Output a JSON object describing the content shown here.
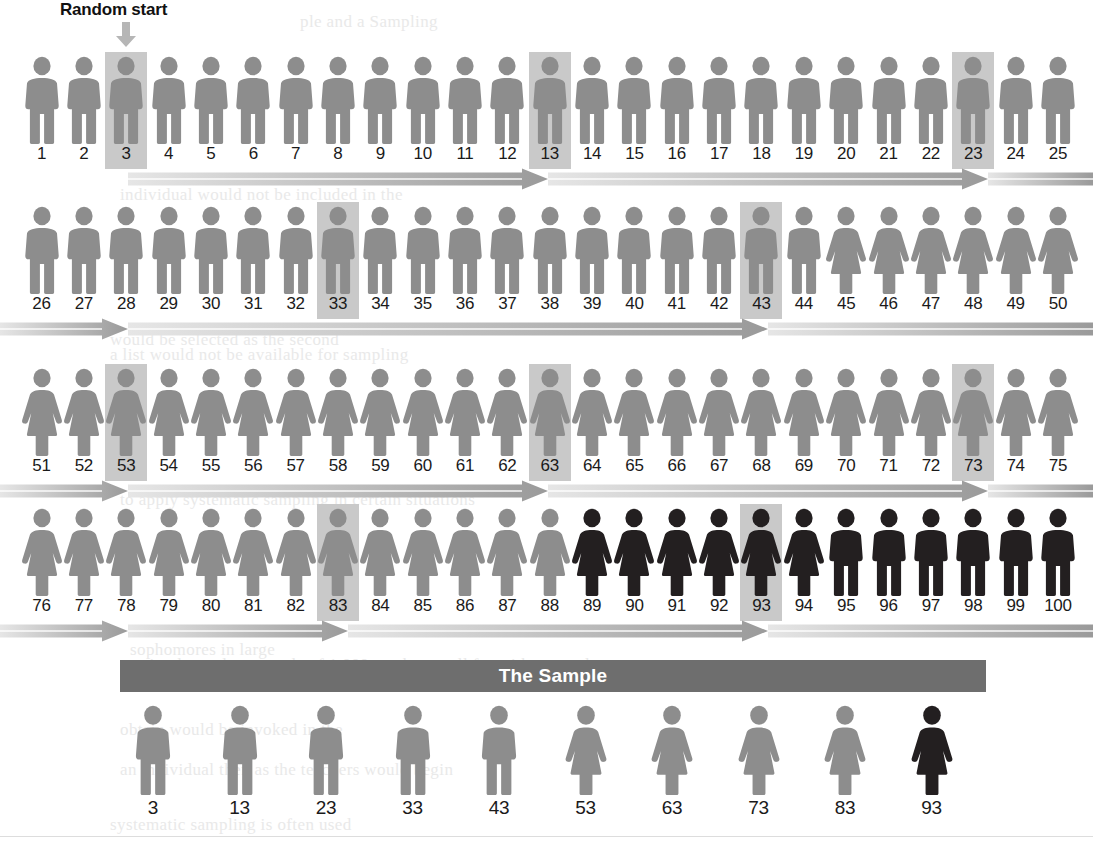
{
  "figure": {
    "title_annotation": "Random start",
    "sample_bar_label": "The Sample",
    "colors": {
      "figure_light_gray": "#8d8d8d",
      "figure_dark": "#231f20",
      "highlight_box": "#c9c9c9",
      "sample_bar": "#6e6e6e",
      "arrow_dark": "#9a9a9a",
      "arrow_light": "#e6e6e6",
      "number_text": "#1a1a1a",
      "background": "#ffffff"
    },
    "icons": {
      "random_start_arrow": "arrow-down-icon",
      "male_figure": "male-person-icon",
      "female_figure": "female-person-icon"
    }
  },
  "chart_data": {
    "type": "diagram",
    "population_size": 100,
    "sample_size": 10,
    "sampling_interval": 10,
    "random_start": 3,
    "selected_units": [
      3,
      13,
      23,
      33,
      43,
      53,
      63,
      73,
      83,
      93
    ],
    "per_row": 25,
    "rows": [
      {
        "start": 1,
        "end": 25,
        "highlighted": [
          3,
          13,
          23
        ]
      },
      {
        "start": 26,
        "end": 50,
        "highlighted": [
          33,
          43
        ]
      },
      {
        "start": 51,
        "end": 75,
        "highlighted": [
          53,
          63,
          73
        ]
      },
      {
        "start": 76,
        "end": 100,
        "highlighted": [
          83,
          93
        ]
      }
    ],
    "unit_styles": {
      "1-44": {
        "sex": "male",
        "shade": "light"
      },
      "45-88": {
        "sex": "female",
        "shade": "light"
      },
      "89-94": {
        "sex": "female",
        "shade": "dark"
      },
      "95-100": {
        "sex": "male",
        "shade": "dark"
      }
    },
    "labels": [
      "1",
      "2",
      "3",
      "4",
      "5",
      "6",
      "7",
      "8",
      "9",
      "10",
      "11",
      "12",
      "13",
      "14",
      "15",
      "16",
      "17",
      "18",
      "19",
      "20",
      "21",
      "22",
      "23",
      "24",
      "25",
      "26",
      "27",
      "28",
      "29",
      "30",
      "31",
      "32",
      "33",
      "34",
      "35",
      "36",
      "37",
      "38",
      "39",
      "40",
      "41",
      "42",
      "43",
      "44",
      "45",
      "46",
      "47",
      "48",
      "49",
      "50",
      "51",
      "52",
      "53",
      "54",
      "55",
      "56",
      "57",
      "58",
      "59",
      "60",
      "61",
      "62",
      "63",
      "64",
      "65",
      "66",
      "67",
      "68",
      "69",
      "70",
      "71",
      "72",
      "73",
      "74",
      "75",
      "76",
      "77",
      "78",
      "79",
      "80",
      "81",
      "82",
      "83",
      "84",
      "85",
      "86",
      "87",
      "88",
      "89",
      "90",
      "91",
      "92",
      "93",
      "94",
      "95",
      "96",
      "97",
      "98",
      "99",
      "100"
    ],
    "sample_units": [
      {
        "n": 3,
        "sex": "male",
        "shade": "light"
      },
      {
        "n": 13,
        "sex": "male",
        "shade": "light"
      },
      {
        "n": 23,
        "sex": "male",
        "shade": "light"
      },
      {
        "n": 33,
        "sex": "male",
        "shade": "light"
      },
      {
        "n": 43,
        "sex": "male",
        "shade": "light"
      },
      {
        "n": 53,
        "sex": "female",
        "shade": "light"
      },
      {
        "n": 63,
        "sex": "female",
        "shade": "light"
      },
      {
        "n": 73,
        "sex": "female",
        "shade": "light"
      },
      {
        "n": 83,
        "sex": "female",
        "shade": "light"
      },
      {
        "n": 93,
        "sex": "female",
        "shade": "dark"
      }
    ],
    "sample_labels": [
      "3",
      "13",
      "23",
      "33",
      "43",
      "53",
      "63",
      "73",
      "83",
      "93"
    ],
    "arrow_bands": [
      {
        "row": 1,
        "y": 168,
        "segments": [
          [
            128,
            548
          ],
          [
            548,
            988
          ],
          [
            988,
            1093
          ]
        ]
      },
      {
        "row": 2,
        "y": 318,
        "segments": [
          [
            0,
            128
          ],
          [
            128,
            768
          ],
          [
            768,
            1093
          ]
        ]
      },
      {
        "row": 3,
        "y": 480,
        "segments": [
          [
            0,
            128
          ],
          [
            128,
            548
          ],
          [
            548,
            988
          ],
          [
            988,
            1093
          ]
        ]
      },
      {
        "row": 4,
        "y": 620,
        "segments": [
          [
            0,
            128
          ],
          [
            128,
            348
          ],
          [
            348,
            768
          ],
          [
            768,
            1093
          ]
        ]
      }
    ]
  },
  "ghost_text": [
    {
      "x": 300,
      "y": 12,
      "t": "ple and a  Sampling"
    },
    {
      "x": 120,
      "y": 185,
      "t": "individual would not be included in the"
    },
    {
      "x": 110,
      "y": 330,
      "t": "would be selected as the second"
    },
    {
      "x": 110,
      "y": 345,
      "t": "a list would not be available for sampling"
    },
    {
      "x": 120,
      "y": 490,
      "t": "to apply systematic sampling in certain situations"
    },
    {
      "x": 130,
      "y": 640,
      "t": "sophomores  in  large"
    },
    {
      "x": 130,
      "y": 655,
      "t": "a simple random sample of 1,000 teachers well for with a sample"
    },
    {
      "x": 120,
      "y": 720,
      "t": "obtain  would be  invoked  in  the"
    },
    {
      "x": 120,
      "y": 760,
      "t": "an  individual  then  as  the  teachers  would  begin"
    },
    {
      "x": 110,
      "y": 815,
      "t": "systematic   sampling   is   often   used"
    }
  ]
}
